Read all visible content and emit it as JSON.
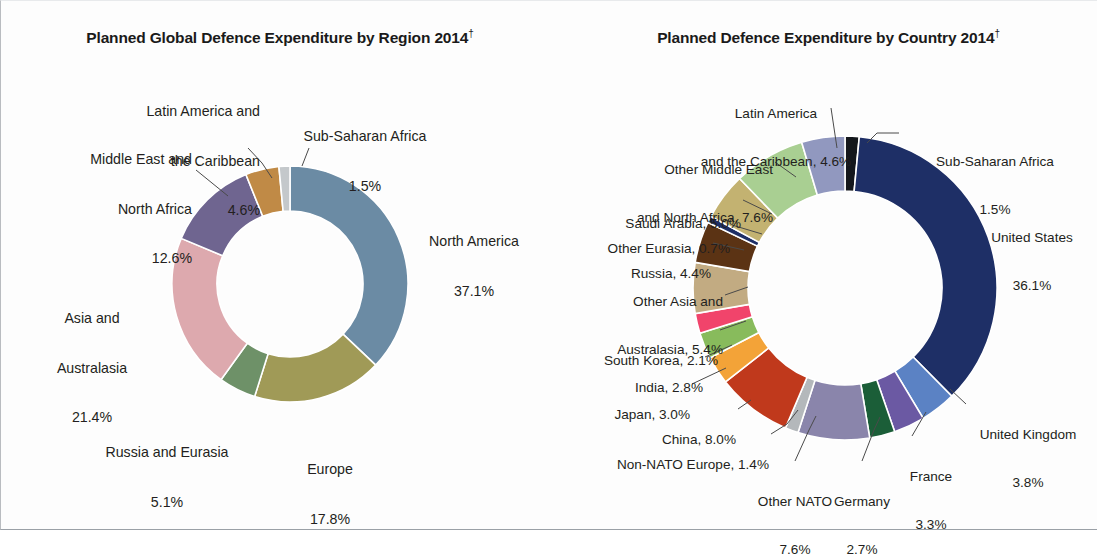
{
  "figure": {
    "background": "#ffffff",
    "text_color": "#231f20"
  },
  "left_chart": {
    "title": "Planned Global Defence Expenditure by Region 2014",
    "title_dagger": "†",
    "labels": [
      {
        "name": "latin-america",
        "lines": [
          "Latin America and",
          "the Caribbean",
          "4.6%"
        ]
      },
      {
        "name": "sub-saharan-africa",
        "lines": [
          "Sub-Saharan Africa",
          "1.5%"
        ]
      },
      {
        "name": "middle-east-north-africa",
        "lines": [
          "Middle East and",
          "North Africa",
          "12.6%"
        ]
      },
      {
        "name": "north-america",
        "lines": [
          "North America",
          "37.1%"
        ]
      },
      {
        "name": "asia-australasia",
        "lines": [
          "Asia and",
          "Australasia",
          "21.4%"
        ]
      },
      {
        "name": "russia-eurasia",
        "lines": [
          "Russia and Eurasia",
          "5.1%"
        ]
      },
      {
        "name": "europe",
        "lines": [
          "Europe",
          "17.8%"
        ]
      }
    ]
  },
  "right_chart": {
    "title": "Planned Defence Expenditure by Country 2014",
    "title_dagger": "†",
    "labels": [
      {
        "name": "latin-america",
        "lines": [
          "Latin America",
          "and the Caribbean, 4.6%"
        ]
      },
      {
        "name": "sub-saharan-africa",
        "lines": [
          "Sub-Saharan Africa",
          "1.5%"
        ]
      },
      {
        "name": "other-middle-east-north-africa",
        "lines": [
          "Other Middle East",
          "and North Africa, 7.6%"
        ]
      },
      {
        "name": "saudi-arabia",
        "lines": [
          "Saudi Arabia, 5.0%"
        ]
      },
      {
        "name": "other-eurasia",
        "lines": [
          "Other Eurasia, 0.7%"
        ]
      },
      {
        "name": "russia",
        "lines": [
          "Russia, 4.4%"
        ]
      },
      {
        "name": "other-asia-australasia",
        "lines": [
          "Other Asia and",
          "Australasia, 5.4%"
        ]
      },
      {
        "name": "south-korea",
        "lines": [
          "South Korea, 2.1%"
        ]
      },
      {
        "name": "india",
        "lines": [
          "India, 2.8%"
        ]
      },
      {
        "name": "japan",
        "lines": [
          "Japan, 3.0%"
        ]
      },
      {
        "name": "china",
        "lines": [
          "China, 8.0%"
        ]
      },
      {
        "name": "non-nato-europe",
        "lines": [
          "Non-NATO Europe, 1.4%"
        ]
      },
      {
        "name": "other-nato",
        "lines": [
          "Other NATO",
          "7.6%"
        ]
      },
      {
        "name": "germany",
        "lines": [
          "Germany",
          "2.7%"
        ]
      },
      {
        "name": "france",
        "lines": [
          "France",
          "3.3%"
        ]
      },
      {
        "name": "united-kingdom",
        "lines": [
          "United Kingdom",
          "3.8%"
        ]
      },
      {
        "name": "united-states",
        "lines": [
          "United States",
          "36.1%"
        ]
      }
    ]
  },
  "chart_data": [
    {
      "type": "pie",
      "variant": "donut",
      "title": "Planned Global Defence Expenditure by Region 2014†",
      "units": "percent of global planned defence expenditure",
      "legend": "labels placed around donut with leader lines",
      "start_angle_deg": 0,
      "direction": "clockwise",
      "categories": [
        "North America",
        "Europe",
        "Russia and Eurasia",
        "Asia and Australasia",
        "Middle East and North Africa",
        "Latin America and the Caribbean",
        "Sub-Saharan Africa"
      ],
      "values": [
        37.1,
        17.8,
        5.1,
        21.4,
        12.6,
        4.6,
        1.5
      ],
      "colors": [
        "#6b8ba4",
        "#a09a57",
        "#6e9168",
        "#dda9ae",
        "#6f6590",
        "#c08a46",
        "#c4c8cb"
      ]
    },
    {
      "type": "pie",
      "variant": "donut",
      "title": "Planned Defence Expenditure by Country 2014†",
      "units": "percent of global planned defence expenditure",
      "legend": "labels placed around donut with leader lines",
      "start_angle_deg": 0,
      "direction": "clockwise",
      "categories": [
        "Sub-Saharan Africa",
        "United States",
        "United Kingdom",
        "France",
        "Germany",
        "Other NATO",
        "Non-NATO Europe",
        "China",
        "Japan",
        "India",
        "South Korea",
        "Other Asia and Australasia",
        "Russia",
        "Other Eurasia",
        "Saudi Arabia",
        "Other Middle East and North Africa",
        "Latin America and the Caribbean"
      ],
      "values": [
        1.5,
        36.1,
        3.8,
        3.3,
        2.7,
        7.6,
        1.4,
        8.0,
        3.0,
        2.8,
        2.1,
        5.4,
        4.4,
        0.7,
        5.0,
        7.6,
        4.6
      ],
      "colors": [
        "#14171c",
        "#1e2f66",
        "#5b82c4",
        "#6b59a3",
        "#1b5e38",
        "#8a85ab",
        "#b4b8bb",
        "#c0391c",
        "#f3a338",
        "#88bb5c",
        "#f1446b",
        "#c2ab82",
        "#5b3314",
        "#1e2f66",
        "#c3b271",
        "#a9cf92",
        "#9198bf"
      ]
    }
  ]
}
